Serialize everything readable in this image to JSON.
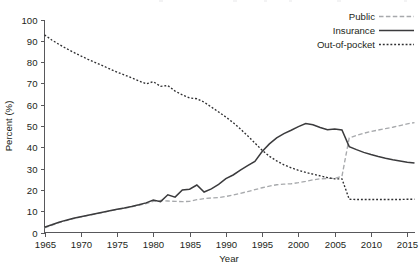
{
  "chart_data": {
    "type": "line",
    "title": "",
    "xlabel": "Year",
    "ylabel": "Percent (%)",
    "xlim": [
      1965,
      2016
    ],
    "ylim": [
      0,
      100
    ],
    "grid": false,
    "legend_position": "top-right",
    "xticks": [
      1965,
      1970,
      1975,
      1980,
      1985,
      1990,
      1995,
      2000,
      2005,
      2010,
      2015
    ],
    "yticks": [
      0,
      10,
      20,
      30,
      40,
      50,
      60,
      70,
      80,
      90,
      100
    ],
    "series": [
      {
        "name": "Public",
        "style": "dashed",
        "color": "#a7a9ac",
        "x": [
          1965,
          1966,
          1967,
          1968,
          1969,
          1970,
          1971,
          1972,
          1973,
          1974,
          1975,
          1976,
          1977,
          1978,
          1979,
          1980,
          1981,
          1982,
          1983,
          1984,
          1985,
          1986,
          1987,
          1988,
          1989,
          1990,
          1991,
          1992,
          1993,
          1994,
          1995,
          1996,
          1997,
          1998,
          1999,
          2000,
          2001,
          2002,
          2003,
          2004,
          2005,
          2006,
          2007,
          2008,
          2009,
          2010,
          2011,
          2012,
          2013,
          2014,
          2015,
          2016
        ],
        "values": [
          2.2,
          3.4,
          4.6,
          5.6,
          6.5,
          7.3,
          8.0,
          8.7,
          9.4,
          10.1,
          10.8,
          11.4,
          12.0,
          12.8,
          13.6,
          14.6,
          15.0,
          14.8,
          14.6,
          14.5,
          14.6,
          15.4,
          15.9,
          16.2,
          16.4,
          16.9,
          17.6,
          18.4,
          19.2,
          20.1,
          21.0,
          21.8,
          22.4,
          22.7,
          22.9,
          23.4,
          24.0,
          24.7,
          25.2,
          25.4,
          25.4,
          26.4,
          44.4,
          45.6,
          46.6,
          47.4,
          48.1,
          48.8,
          49.4,
          50.2,
          51.0,
          51.6
        ]
      },
      {
        "name": "Insurance",
        "style": "solid",
        "color": "#3b3b3d",
        "x": [
          1965,
          1966,
          1967,
          1968,
          1969,
          1970,
          1971,
          1972,
          1973,
          1974,
          1975,
          1976,
          1977,
          1978,
          1979,
          1980,
          1981,
          1982,
          1983,
          1984,
          1985,
          1986,
          1987,
          1988,
          1989,
          1990,
          1991,
          1992,
          1993,
          1994,
          1995,
          1996,
          1997,
          1998,
          1999,
          2000,
          2001,
          2002,
          2003,
          2004,
          2005,
          2006,
          2007,
          2008,
          2009,
          2010,
          2011,
          2012,
          2013,
          2014,
          2015,
          2016
        ],
        "values": [
          2.5,
          3.6,
          4.8,
          5.8,
          6.7,
          7.4,
          8.1,
          8.8,
          9.5,
          10.2,
          10.9,
          11.5,
          12.2,
          13.0,
          13.9,
          15.2,
          14.5,
          17.7,
          16.6,
          20.0,
          20.3,
          22.3,
          19.0,
          20.5,
          22.6,
          25.3,
          27.0,
          29.3,
          31.4,
          33.4,
          38.0,
          41.6,
          44.4,
          46.4,
          48.0,
          49.7,
          51.2,
          50.6,
          49.3,
          48.2,
          48.6,
          48.1,
          40.3,
          38.9,
          37.6,
          36.6,
          35.7,
          34.9,
          34.2,
          33.6,
          33.0,
          32.6
        ]
      },
      {
        "name": "Out-of-pocket",
        "style": "dotted",
        "color": "#2f2f31",
        "x": [
          1965,
          1966,
          1967,
          1968,
          1969,
          1970,
          1971,
          1972,
          1973,
          1974,
          1975,
          1976,
          1977,
          1978,
          1979,
          1980,
          1981,
          1982,
          1983,
          1984,
          1985,
          1986,
          1987,
          1988,
          1989,
          1990,
          1991,
          1992,
          1993,
          1994,
          1995,
          1996,
          1997,
          1998,
          1999,
          2000,
          2001,
          2002,
          2003,
          2004,
          2005,
          2006,
          2007,
          2008,
          2009,
          2010,
          2011,
          2012,
          2013,
          2014,
          2015,
          2016
        ],
        "values": [
          92.8,
          90.4,
          88.3,
          86.4,
          84.6,
          82.9,
          81.3,
          79.8,
          78.3,
          76.8,
          75.3,
          74.0,
          72.6,
          71.2,
          69.8,
          70.8,
          68.6,
          69.0,
          66.4,
          64.6,
          63.2,
          62.8,
          61.2,
          58.9,
          56.6,
          54.2,
          51.6,
          48.6,
          45.4,
          42.0,
          38.6,
          35.8,
          33.6,
          31.8,
          30.4,
          29.2,
          28.2,
          27.4,
          26.6,
          25.8,
          25.2,
          25.2,
          15.6,
          15.5,
          15.5,
          15.5,
          15.5,
          15.5,
          15.5,
          15.5,
          15.6,
          15.6
        ]
      }
    ]
  },
  "legend": {
    "items": [
      {
        "label": "Public"
      },
      {
        "label": "Insurance"
      },
      {
        "label": "Out-of-pocket"
      }
    ]
  }
}
